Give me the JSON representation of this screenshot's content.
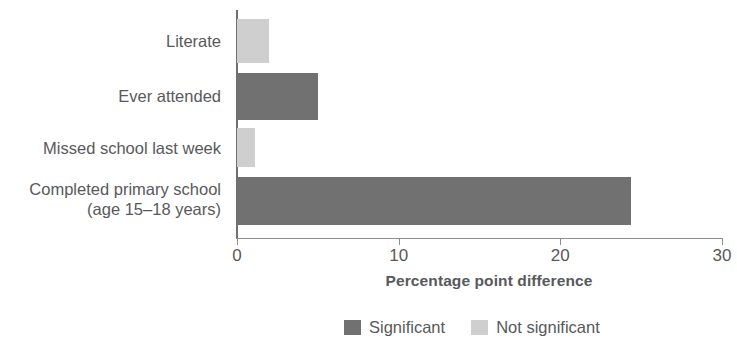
{
  "chart_data": {
    "type": "bar",
    "orientation": "horizontal",
    "title": "",
    "xlabel": "Percentage point difference",
    "ylabel": "",
    "xlim": [
      0,
      30
    ],
    "xticks": [
      0,
      10,
      20,
      30
    ],
    "xtick_labels": [
      "0",
      "10",
      "20",
      "30"
    ],
    "grid": false,
    "categories": [
      "Literate",
      "Ever attended",
      "Missed school last week",
      "Completed primary school\n(age 15–18 years)"
    ],
    "category_lines": [
      [
        "Literate"
      ],
      [
        "Ever attended"
      ],
      [
        "Missed school last week"
      ],
      [
        "Completed primary school",
        "(age 15–18 years)"
      ]
    ],
    "values": [
      2.0,
      5.0,
      1.1,
      24.4
    ],
    "significance": [
      "Not significant",
      "Significant",
      "Not significant",
      "Significant"
    ],
    "legend": {
      "position": "bottom",
      "entries": [
        {
          "label": "Significant",
          "color": "#717172",
          "key": "sig"
        },
        {
          "label": "Not significant",
          "color": "#cfcfd0",
          "key": "notsig"
        }
      ]
    },
    "colors": {
      "significant": "#717172",
      "not_significant": "#cfcfd0",
      "axis": "#6e6f71",
      "text": "#58595b",
      "background": "#ffffff"
    }
  }
}
